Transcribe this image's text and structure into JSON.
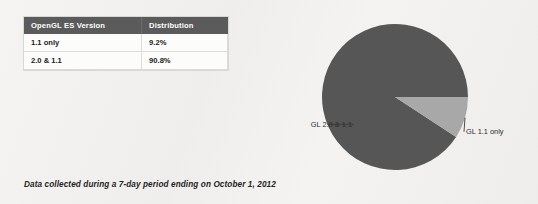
{
  "table": {
    "headers": [
      "OpenGL ES Version",
      "Distribution"
    ],
    "rows": [
      {
        "version": "1.1 only",
        "distribution": "9.2%"
      },
      {
        "version": "2.0 & 1.1",
        "distribution": "90.8%"
      }
    ]
  },
  "caption": "Data collected during a 7-day period ending on October 1, 2012",
  "colors": {
    "header_bg": "#5b5b5b",
    "slice_major": "#565656",
    "slice_minor": "#a8a8a8",
    "page_bg": "#f2f1ef"
  },
  "chart_data": {
    "type": "pie",
    "title": "",
    "categories": [
      "GL 2.0 & 1.1",
      "GL 1.1 only"
    ],
    "values": [
      90.8,
      9.2
    ],
    "value_unit": "%",
    "slice_colors": [
      "#565656",
      "#a8a8a8"
    ],
    "labels": [
      {
        "text": "GL 2.0 & 1.1",
        "position": "left"
      },
      {
        "text": "GL 1.1 only",
        "position": "right"
      }
    ],
    "legend": "leader-lines",
    "grid": false,
    "start_angle_deg": 0,
    "direction": "clockwise"
  }
}
